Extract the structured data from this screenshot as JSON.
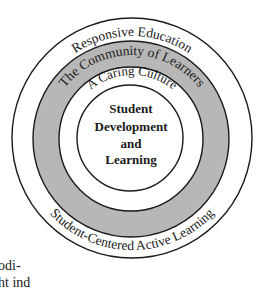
{
  "diagram": {
    "type": "concentric-circles",
    "colors": {
      "background": "#ffffff",
      "stroke": "#1a1a1a",
      "community_ring_fill": "#b7b7b7",
      "text": "#1a1a1a"
    },
    "rings": [
      {
        "name": "outer-ring",
        "top_label": "Responsive Education",
        "bottom_label": "Student-Centered Active Learning"
      },
      {
        "name": "community-ring",
        "top_label": "The Community of Learners"
      },
      {
        "name": "caring-ring",
        "top_label": "A Caring Culture"
      }
    ],
    "center": {
      "lines": [
        "Student",
        "Development",
        "and",
        "Learning"
      ]
    }
  },
  "body_text_fragments": {
    "line1": "odi-",
    "line2": "ht ind"
  }
}
